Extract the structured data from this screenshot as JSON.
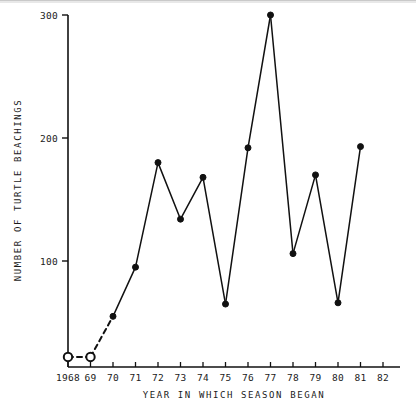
{
  "chart_data": {
    "type": "line",
    "title": "",
    "xlabel": "YEAR IN WHICH SEASON BEGAN",
    "ylabel": "NUMBER OF TURTLE BEACHINGS",
    "x": [
      1968,
      1969,
      1970,
      1971,
      1972,
      1973,
      1974,
      1975,
      1976,
      1977,
      1978,
      1979,
      1980,
      1981
    ],
    "values": [
      22,
      22,
      55,
      95,
      180,
      134,
      168,
      65,
      192,
      300,
      106,
      170,
      66,
      193
    ],
    "xtick_labels": [
      "1968",
      "69",
      "70",
      "71",
      "72",
      "73",
      "74",
      "75",
      "76",
      "77",
      "78",
      "79",
      "80",
      "81",
      "82"
    ],
    "xtick_values": [
      1968,
      1969,
      1970,
      1971,
      1972,
      1973,
      1974,
      1975,
      1976,
      1977,
      1978,
      1979,
      1980,
      1981,
      1982
    ],
    "ytick_labels": [
      "100",
      "200",
      "300"
    ],
    "ytick_values": [
      100,
      200,
      300
    ],
    "xlim": [
      1968,
      1982
    ],
    "ylim": [
      0,
      300
    ],
    "grid": false,
    "legend": false,
    "marker_styles": {
      "open_circle_years": [
        1968,
        1969
      ],
      "filled_circle_years": [
        1970,
        1971,
        1972,
        1973,
        1974,
        1975,
        1976,
        1977,
        1978,
        1979,
        1980,
        1981
      ]
    },
    "line_styles": {
      "dashed_segment_years": [
        1968,
        1969,
        1970
      ],
      "solid_segment_years": [
        1970,
        1971,
        1972,
        1973,
        1974,
        1975,
        1976,
        1977,
        1978,
        1979,
        1980,
        1981
      ]
    },
    "series_color": "#111111",
    "axis_color": "#111111"
  }
}
